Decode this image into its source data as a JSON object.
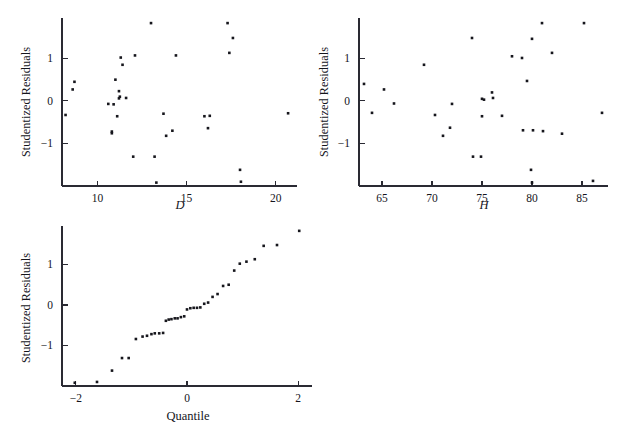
{
  "figure": {
    "background": "#ffffff",
    "point_color": "#16161c",
    "axis_color": "#2a2a33",
    "panel_count": 3
  },
  "panels": {
    "d_plot": {
      "name": "Studentized Residuals vs D",
      "xlabel": "D",
      "ylabel": "Studentized Residuals",
      "xticks": [
        "10",
        "15",
        "20"
      ],
      "yticks": [
        "1",
        "0",
        "-1"
      ]
    },
    "h_plot": {
      "name": "Studentized Residuals vs H",
      "xlabel": "H",
      "ylabel": "Studentized Residuals",
      "xticks": [
        "65",
        "70",
        "75",
        "80",
        "85"
      ],
      "yticks": [
        "1",
        "0",
        "-1"
      ]
    },
    "qq_plot": {
      "name": "Normal Quantile Plot of Studentized Residuals",
      "xlabel": "Quantile",
      "ylabel": "Studentized Residuals",
      "xticks": [
        "-2",
        "0",
        "2"
      ],
      "yticks": [
        "1",
        "0",
        "-1"
      ]
    }
  },
  "chart_data": [
    {
      "type": "scatter",
      "id": "d_plot",
      "title": "",
      "xlabel": "D",
      "ylabel": "Studentized Residuals",
      "xlim": [
        8.0,
        21.2
      ],
      "ylim": [
        -2.0,
        1.95
      ],
      "xticks": [
        10,
        15,
        20
      ],
      "yticks": [
        -1,
        0,
        1
      ],
      "grid": false,
      "legend": null,
      "x": [
        8.2,
        8.6,
        8.7,
        10.6,
        10.8,
        10.8,
        10.9,
        11.0,
        11.1,
        11.2,
        11.2,
        11.25,
        11.3,
        11.4,
        11.6,
        12.0,
        12.1,
        13.0,
        13.2,
        13.3,
        13.7,
        13.85,
        14.2,
        14.4,
        16.0,
        16.2,
        16.3,
        17.3,
        17.4,
        17.6,
        18.0,
        18.05,
        20.7
      ],
      "y": [
        -0.33,
        0.27,
        0.45,
        -0.07,
        -0.72,
        -0.76,
        -0.08,
        0.5,
        -0.36,
        0.06,
        0.23,
        0.1,
        1.02,
        0.85,
        0.07,
        -1.31,
        1.07,
        1.83,
        -1.31,
        -1.92,
        -0.3,
        -0.82,
        -0.7,
        1.07,
        -0.36,
        -0.64,
        -0.35,
        1.83,
        1.13,
        1.48,
        -1.62,
        -1.9,
        -0.29
      ]
    },
    {
      "type": "scatter",
      "id": "h_plot",
      "title": "",
      "xlabel": "H",
      "ylabel": "Studentized Residuals",
      "xlim": [
        62.7,
        87.6
      ],
      "ylim": [
        -2.0,
        1.95
      ],
      "xticks": [
        65,
        70,
        75,
        80,
        85
      ],
      "yticks": [
        -1,
        0,
        1
      ],
      "grid": false,
      "legend": null,
      "x": [
        63.2,
        64.0,
        65.2,
        66.2,
        69.2,
        70.3,
        71.1,
        71.8,
        72.0,
        74.0,
        74.1,
        74.9,
        75.0,
        75.0,
        75.2,
        76.0,
        76.1,
        77.0,
        78.0,
        79.0,
        79.1,
        79.5,
        79.9,
        80.0,
        80.0,
        80.1,
        81.0,
        81.1,
        82.0,
        83.0,
        85.2,
        86.1,
        87.0
      ],
      "y": [
        0.4,
        -0.28,
        0.27,
        -0.06,
        0.85,
        -0.33,
        -0.82,
        -0.63,
        -0.07,
        1.48,
        -1.31,
        -1.31,
        0.05,
        -0.36,
        0.03,
        0.2,
        0.07,
        -0.35,
        1.05,
        1.01,
        -0.69,
        0.47,
        -1.62,
        1.46,
        -1.92,
        -0.69,
        1.83,
        -0.71,
        1.13,
        -0.77,
        1.83,
        -1.88,
        -0.28
      ]
    },
    {
      "type": "scatter",
      "id": "qq_plot",
      "title": "",
      "xlabel": "Quantile",
      "ylabel": "Studentized Residuals",
      "xlim": [
        -2.25,
        2.25
      ],
      "ylim": [
        -2.0,
        1.95
      ],
      "xticks": [
        -2,
        0,
        2
      ],
      "yticks": [
        -1,
        0,
        1
      ],
      "grid": false,
      "legend": null,
      "x": [
        -2.02,
        -1.62,
        -1.35,
        -1.17,
        -1.05,
        -0.92,
        -0.8,
        -0.72,
        -0.64,
        -0.58,
        -0.5,
        -0.43,
        -0.38,
        -0.33,
        -0.28,
        -0.22,
        -0.17,
        -0.11,
        -0.05,
        0.0,
        0.06,
        0.12,
        0.18,
        0.24,
        0.31,
        0.38,
        0.46,
        0.55,
        0.65,
        0.75,
        0.85,
        0.95,
        1.07,
        1.22,
        1.38,
        1.62,
        2.02
      ],
      "y": [
        -1.92,
        -1.9,
        -1.62,
        -1.31,
        -1.31,
        -0.84,
        -0.78,
        -0.76,
        -0.72,
        -0.7,
        -0.7,
        -0.69,
        -0.39,
        -0.36,
        -0.35,
        -0.33,
        -0.33,
        -0.3,
        -0.28,
        -0.11,
        -0.08,
        -0.07,
        -0.07,
        -0.06,
        0.03,
        0.06,
        0.2,
        0.27,
        0.47,
        0.5,
        0.85,
        1.02,
        1.07,
        1.13,
        1.46,
        1.48,
        1.83
      ]
    }
  ]
}
